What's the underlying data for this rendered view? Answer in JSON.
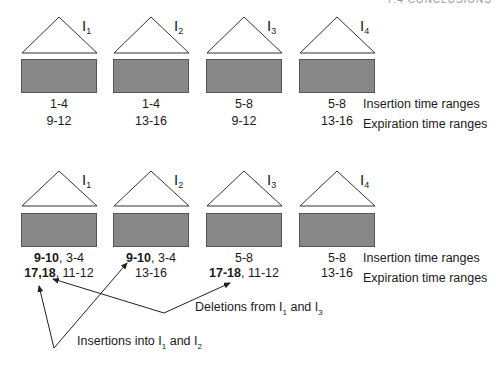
{
  "header": {
    "text": "7.4 CONCLUSIONS"
  },
  "colors": {
    "box_fill": "#888888",
    "box_border": "#555555",
    "line": "#222222"
  },
  "legend": {
    "insertion_label": "Insertion time ranges",
    "expiration_label": "Expiration time ranges"
  },
  "top_panel": {
    "indexes": [
      {
        "name": "I",
        "sub": "1",
        "insertion": "1-4",
        "expiration": "9-12"
      },
      {
        "name": "I",
        "sub": "2",
        "insertion": "1-4",
        "expiration": "13-16"
      },
      {
        "name": "I",
        "sub": "3",
        "insertion": "5-8",
        "expiration": "9-12"
      },
      {
        "name": "I",
        "sub": "4",
        "insertion": "5-8",
        "expiration": "13-16"
      }
    ]
  },
  "bottom_panel": {
    "indexes": [
      {
        "name": "I",
        "sub": "1",
        "insertion_bold": "9-10",
        "insertion_rest": ", 3-4",
        "expiration_bold": "17,18",
        "expiration_rest": ", 11-12"
      },
      {
        "name": "I",
        "sub": "2",
        "insertion_bold": "9-10",
        "insertion_rest": ", 3-4",
        "expiration_bold": "",
        "expiration_rest": "13-16"
      },
      {
        "name": "I",
        "sub": "3",
        "insertion_bold": "",
        "insertion_rest": "5-8",
        "expiration_bold": "17-18",
        "expiration_rest": ", 11-12"
      },
      {
        "name": "I",
        "sub": "4",
        "insertion_bold": "",
        "insertion_rest": "5-8",
        "expiration_bold": "",
        "expiration_rest": "13-16"
      }
    ]
  },
  "annotations": {
    "deletions": {
      "prefix": "Deletions from I",
      "sub1": "1",
      "mid": " and I",
      "sub2": "3"
    },
    "insertions": {
      "prefix": "Insertions into I",
      "sub1": "1",
      "mid": " and I",
      "sub2": "2"
    }
  }
}
